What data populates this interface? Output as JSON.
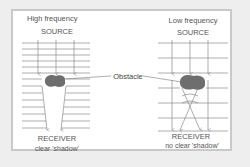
{
  "diagram": {
    "left_panel": {
      "title": "High frequency",
      "source_label": "SOURCE",
      "receiver_label": "RECEIVER",
      "caption": "clear 'shadow'"
    },
    "right_panel": {
      "title": "Low frequency",
      "source_label": "SOURCE",
      "receiver_label": "RECEIVER",
      "caption": "no clear 'shadow'"
    },
    "obstacle_label": "Obstacle",
    "colors": {
      "background": "#eeeeee",
      "panel": "#ffffff",
      "border": "#c9c9c9",
      "lines": "#8a8a8a",
      "obstacle": "#6e6e6e"
    }
  }
}
